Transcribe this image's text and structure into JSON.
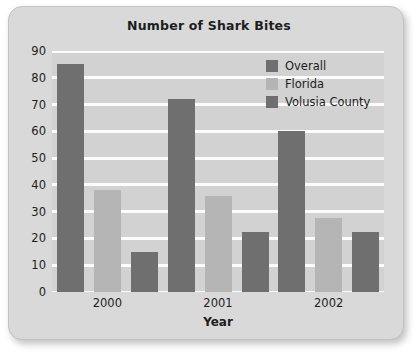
{
  "chart_data": {
    "type": "bar",
    "title": "Number of Shark Bites",
    "xlabel": "Year",
    "ylabel": "",
    "categories": [
      "2000",
      "2001",
      "2002"
    ],
    "series": [
      {
        "name": "Overall",
        "color": "#6f6f6f",
        "values": [
          85,
          72,
          60
        ]
      },
      {
        "name": "Florida",
        "color": "#b5b5b5",
        "values": [
          38,
          36,
          27.5
        ]
      },
      {
        "name": "Volusia County",
        "color": "#6f6f6f",
        "values": [
          15,
          22.5,
          22.5
        ]
      }
    ],
    "ylim": [
      0,
      90
    ],
    "ytick_labels": [
      "90",
      "80",
      "70",
      "60",
      "50",
      "40",
      "30",
      "20",
      "10",
      "0"
    ],
    "ytick_values": [
      90,
      80,
      70,
      60,
      50,
      40,
      30,
      20,
      10,
      0
    ],
    "grid": true,
    "gridline_color": "#fcfcfc",
    "legend_position": "top-right",
    "plot_background": "#d2d2d2",
    "figure_background": "#d9d9d9"
  }
}
